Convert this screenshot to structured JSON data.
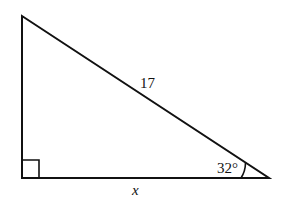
{
  "diagram": {
    "type": "right-triangle",
    "vertices": {
      "top": [
        22,
        16
      ],
      "right_angle": [
        22,
        178
      ],
      "acute": [
        269,
        178
      ]
    },
    "labels": {
      "hypotenuse": "17",
      "angle": "32°",
      "base": "x"
    },
    "right_angle_marker": true,
    "stroke_color": "#111111",
    "background_color": "#ffffff"
  }
}
